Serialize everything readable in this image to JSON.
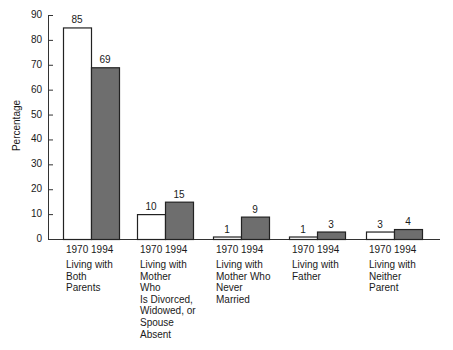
{
  "chart_data": {
    "type": "bar",
    "title": "",
    "xlabel": "",
    "ylabel": "Percentage",
    "ylim": [
      0,
      90
    ],
    "yticks": [
      0,
      10,
      20,
      30,
      40,
      50,
      60,
      70,
      80,
      90
    ],
    "grid": false,
    "legend": "none (year labels under each bar pair)",
    "categories": [
      "Living with Both Parents",
      "Living with Mother Who Is Divorced, Widowed, or Spouse Absent",
      "Living with Mother Who Never Married",
      "Living with Father",
      "Living with Neither Parent"
    ],
    "category_lines": [
      [
        "Living with",
        "Both",
        "Parents"
      ],
      [
        "Living with",
        "Mother",
        "Who",
        "Is Divorced,",
        "Widowed, or",
        "Spouse",
        "Absent"
      ],
      [
        "Living with",
        "Mother Who",
        "Never",
        "Married"
      ],
      [
        "Living with",
        "Father"
      ],
      [
        "Living with",
        "Neither",
        "Parent"
      ]
    ],
    "series": [
      {
        "name": "1970",
        "color": "#ffffff",
        "values": [
          85,
          10,
          1,
          1,
          3
        ]
      },
      {
        "name": "1994",
        "color": "#6e6e6e",
        "values": [
          69,
          15,
          9,
          3,
          4
        ]
      }
    ],
    "year_labels": [
      "1970",
      "1994"
    ]
  }
}
